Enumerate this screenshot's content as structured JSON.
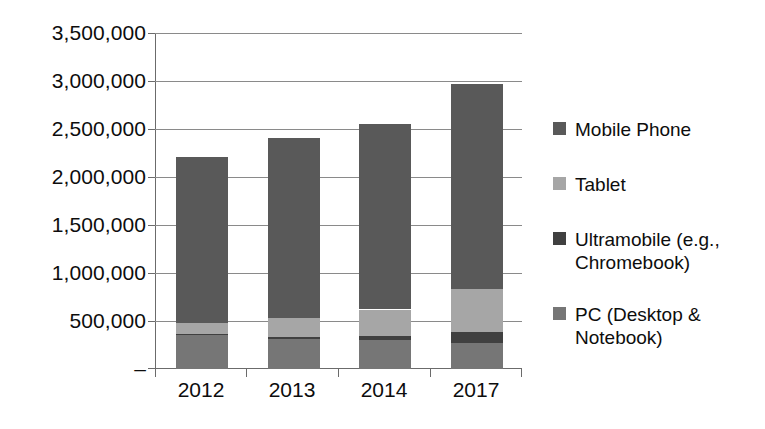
{
  "chart_data": {
    "type": "bar",
    "subtype": "stacked-bar",
    "title": "",
    "subtitle": "",
    "xlabel": "",
    "ylabel": "",
    "categories": [
      "2012",
      "2013",
      "2014",
      "2017"
    ],
    "ylim": [
      0,
      3500000
    ],
    "ytick_values": [
      0,
      500000,
      1000000,
      1500000,
      2000000,
      2500000,
      3000000,
      3500000
    ],
    "ytick_labels": [
      "–",
      "500,000",
      "1,000,000",
      "1,500,000",
      "2,000,000",
      "2,500,000",
      "3,000,000",
      "3,500,000"
    ],
    "grid": true,
    "grid_axis": "y",
    "legend_position": "right",
    "stack_order_bottom_to_top": [
      "PC (Desktop & Notebook)",
      "Ultramobile (e.g., Chromebook)",
      "Tablet",
      "Mobile Phone"
    ],
    "series": [
      {
        "name": "Mobile Phone",
        "color": "#595959",
        "values": [
          1730000,
          1875000,
          1930000,
          2140000
        ]
      },
      {
        "name": "Tablet",
        "color": "#a6a6a6",
        "values": [
          120000,
          200000,
          280000,
          440000
        ]
      },
      {
        "name": "Ultramobile (e.g., Chromebook)",
        "color": "#404040",
        "values": [
          10000,
          20000,
          40000,
          120000
        ]
      },
      {
        "name": "PC (Desktop & Notebook)",
        "color": "#767676",
        "values": [
          350000,
          315000,
          300000,
          270000
        ]
      }
    ],
    "totals": [
      2210000,
      2410000,
      2550000,
      2970000
    ]
  },
  "axis": {
    "y_labels": [
      "3,500,000",
      "3,000,000",
      "2,500,000",
      "2,000,000",
      "1,500,000",
      "1,000,000",
      "500,000",
      "–"
    ],
    "x_labels": [
      "2012",
      "2013",
      "2014",
      "2017"
    ]
  },
  "legend": {
    "items": [
      {
        "label": "Mobile Phone",
        "color": "#595959"
      },
      {
        "label": "Tablet",
        "color": "#a6a6a6"
      },
      {
        "label": "Ultramobile (e.g.,\nChromebook)",
        "color": "#404040"
      },
      {
        "label": "PC (Desktop &\nNotebook)",
        "color": "#767676"
      }
    ]
  },
  "colors": {
    "gridline": "#8a8a8a",
    "axis": "#6b6b6b",
    "text": "#0d0d0d",
    "background": "#ffffff"
  }
}
